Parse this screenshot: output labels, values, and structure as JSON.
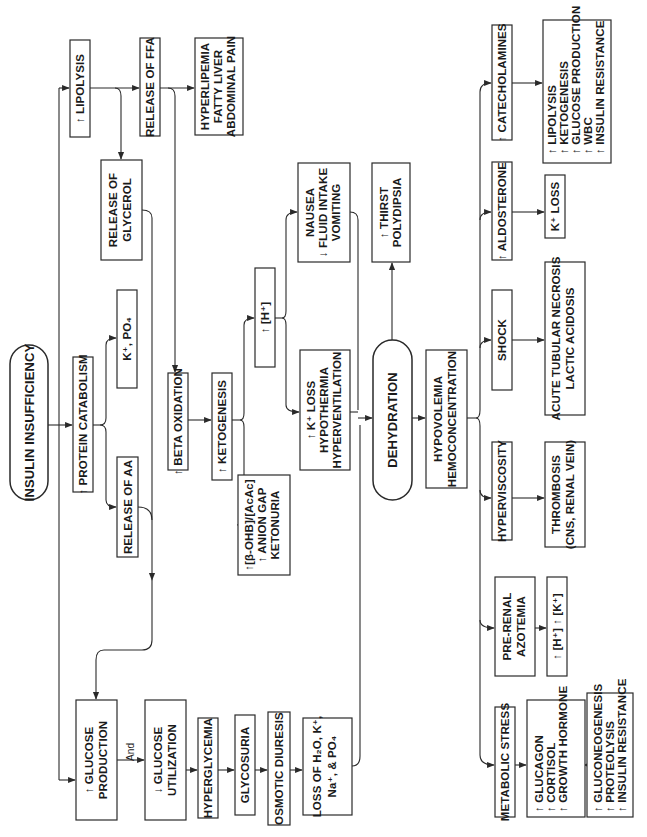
{
  "diagram": {
    "orientation": "rotated 90 degrees counter-clockwise",
    "accent_color": "#2a2a2a",
    "nodes": {
      "insulin_insufficiency": "INSULIN INSUFFICIENCY",
      "lipolysis": "↑ LIPOLYSIS",
      "release_ffa": "RELEASE OF FFA",
      "hyperlipemia": [
        "HYPERLIPEMIA",
        "FATTY LIVER",
        "ABDOMINAL PAIN"
      ],
      "release_glycerol": [
        "RELEASE OF",
        "GLYCEROL"
      ],
      "protein_catabolism": "↑ PROTEIN CATABOLISM",
      "k_po4": "K⁺, PO₄",
      "release_aa": "RELEASE OF AA",
      "beta_oxidation": "↑ BETA OXIDATION",
      "ketogenesis": "↑ KETOGENESIS",
      "ketone_markers": [
        "↑[β-OHB]/[AcAc]",
        "↑ ANION GAP",
        "KETONURIA"
      ],
      "hydrogen": "↑ [H⁺]",
      "k_loss_hypothermia": [
        "↑ K⁺ LOSS",
        "HYPOTHERMIA",
        "HYPERVENTILATION"
      ],
      "nausea": [
        "NAUSEA",
        "↓ FLUID INTAKE",
        "VOMITING"
      ],
      "thirst": [
        "↑ THIRST",
        "POLYDIPSIA"
      ],
      "dehydration": "DEHYDRATION",
      "hypovolemia": [
        "HYPOVOLEMIA",
        "HEMOCONCENTRATION"
      ],
      "catecholamines": "↑ CATECHOLAMINES",
      "catecholamine_effects": [
        "↑ LIPOLYSIS",
        "↑ KETOGENESIS",
        "↑ GLUCOSE PRODUCTION",
        "↑ WBC",
        "↑ INSULIN RESISTANCE"
      ],
      "aldosterone": "↑ ALDOSTERONE",
      "k_loss": "K⁺ LOSS",
      "shock": "SHOCK",
      "atn": [
        "ACUTE TUBULAR NECROSIS",
        "LACTIC ACIDOSIS"
      ],
      "hyperviscosity": "HYPERVISCOSITY",
      "thrombosis": [
        "THROMBOSIS",
        "(CNS, RENAL VEIN)"
      ],
      "prerenal": [
        "PRE-RENAL",
        "AZOTEMIA"
      ],
      "h_k": "↑ [H⁺]  ↑ [K⁺]",
      "metabolic_stress": "METABOLIC STRESS",
      "hormones": [
        "↑ GLUCAGON",
        "↑ CORTISOL",
        "↑ GROWTH HORMONE"
      ],
      "hormone_effects": [
        "↑ GLUCONEOGENESIS",
        "↑ PROTEOLYSIS",
        "↑ INSULIN RESISTANCE"
      ],
      "glucose_production": [
        "↑ GLUCOSE",
        "PRODUCTION"
      ],
      "and_label": "And",
      "glucose_utilization": [
        "↓ GLUCOSE",
        "UTILIZATION"
      ],
      "hyperglycemia": "HYPERGLYCEMIA",
      "glycosuria": "GLYCOSURIA",
      "osmotic_diuresis": "OSMOTIC DIURESIS",
      "fluid_loss": [
        "LOSS OF H₂O, K⁺,",
        "Na⁺, & PO₄"
      ]
    }
  }
}
